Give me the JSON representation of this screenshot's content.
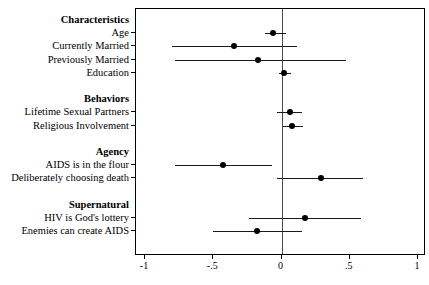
{
  "chart_data": {
    "type": "scatter",
    "chart_subtype": "forest-plot",
    "title": "",
    "subtitle": "",
    "xlabel": "",
    "ylabel": "",
    "xlim": [
      -1,
      1
    ],
    "xticks": [
      -1,
      -0.5,
      0,
      0.5,
      1
    ],
    "xticklabels": [
      "-1",
      "-.5",
      "0",
      ".5",
      "1"
    ],
    "grid": false,
    "legend": null,
    "reference_line": 0,
    "rows": [
      {
        "kind": "group",
        "label": "Characteristics"
      },
      {
        "kind": "estimate",
        "label": "Age",
        "estimate": -0.06,
        "ci_low": -0.12,
        "ci_high": 0.03
      },
      {
        "kind": "estimate",
        "label": "Currently Married",
        "estimate": -0.35,
        "ci_low": -0.8,
        "ci_high": 0.11
      },
      {
        "kind": "estimate",
        "label": "Previously Married",
        "estimate": -0.17,
        "ci_low": -0.78,
        "ci_high": 0.47
      },
      {
        "kind": "estimate",
        "label": "Education",
        "estimate": 0.02,
        "ci_low": -0.02,
        "ci_high": 0.07
      },
      {
        "kind": "spacer",
        "label": ""
      },
      {
        "kind": "group",
        "label": "Behaviors"
      },
      {
        "kind": "estimate",
        "label": "Lifetime Sexual Partners",
        "estimate": 0.06,
        "ci_low": -0.03,
        "ci_high": 0.15
      },
      {
        "kind": "estimate",
        "label": "Religious Involvement",
        "estimate": 0.08,
        "ci_low": 0.01,
        "ci_high": 0.16
      },
      {
        "kind": "spacer",
        "label": ""
      },
      {
        "kind": "group",
        "label": "Agency"
      },
      {
        "kind": "estimate",
        "label": "AIDS is in the flour",
        "estimate": -0.43,
        "ci_low": -0.78,
        "ci_high": -0.07
      },
      {
        "kind": "estimate",
        "label": "Deliberately choosing death",
        "estimate": 0.29,
        "ci_low": -0.03,
        "ci_high": 0.6
      },
      {
        "kind": "spacer",
        "label": ""
      },
      {
        "kind": "group",
        "label": "Supernatural"
      },
      {
        "kind": "estimate",
        "label": "HIV is God's lottery",
        "estimate": 0.17,
        "ci_low": -0.24,
        "ci_high": 0.58
      },
      {
        "kind": "estimate",
        "label": "Enemies can create AIDS",
        "estimate": -0.18,
        "ci_low": -0.5,
        "ci_high": 0.15
      }
    ],
    "colors": {
      "point": "#000000",
      "ci_line": "#1a1a1a",
      "reference_line": "#4a4a4a",
      "frame": "#000000",
      "background": "#ffffff",
      "text": "#000000"
    }
  }
}
